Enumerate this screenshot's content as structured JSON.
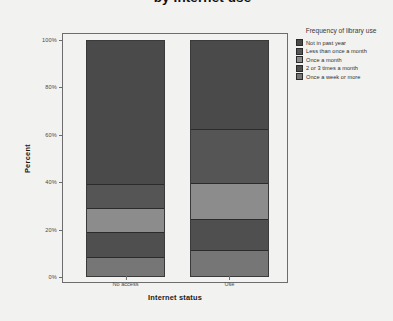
{
  "title": "by Internet use",
  "axes": {
    "ylabel": "Percent",
    "xlabel": "Internet status",
    "yticks": [
      "0%",
      "20%",
      "40%",
      "60%",
      "80%",
      "100%"
    ],
    "xticks": [
      "No access",
      "Use"
    ]
  },
  "legend": {
    "title": "Frequency of library use",
    "items": [
      {
        "label": "Not in past year",
        "color": "#4a4a4a"
      },
      {
        "label": "Less than once a month",
        "color": "#555555"
      },
      {
        "label": "Once a month",
        "color": "#8c8c8c"
      },
      {
        "label": "2 or 3 times a month",
        "color": "#4f4f4f"
      },
      {
        "label": "Once a week or more",
        "color": "#767676"
      }
    ]
  },
  "chart_data": {
    "type": "bar",
    "subtype": "stacked-100-percent",
    "title": "by Internet use",
    "xlabel": "Internet status",
    "ylabel": "Percent",
    "ylim": [
      0,
      100
    ],
    "ytick_values": [
      0,
      20,
      40,
      60,
      80,
      100
    ],
    "grid": false,
    "legend_position": "right",
    "legend_title": "Frequency of library use",
    "categories": [
      "No access",
      "Use"
    ],
    "series": [
      {
        "name": "Not in past year",
        "color": "#4a4a4a",
        "values": [
          62,
          38
        ]
      },
      {
        "name": "Less than once a month",
        "color": "#555555",
        "values": [
          10,
          23
        ]
      },
      {
        "name": "Once a month",
        "color": "#8c8c8c",
        "values": [
          10,
          15
        ]
      },
      {
        "name": "2 or 3 times a month",
        "color": "#4f4f4f",
        "values": [
          10,
          13
        ]
      },
      {
        "name": "Once a week or more",
        "color": "#767676",
        "values": [
          8,
          11
        ]
      }
    ]
  }
}
